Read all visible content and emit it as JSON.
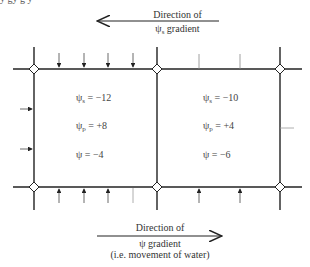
{
  "caption_fragment": "y       gy                    g y",
  "top_arrow": {
    "line1": "Direction of",
    "line2_symbol": "ψ",
    "line2_sub": "s",
    "line2_rest": " gradient",
    "direction": "left"
  },
  "bottom_arrow": {
    "line1": "Direction of",
    "line2": "ψ gradient",
    "line3": "(i.e. movement of water)",
    "direction": "right"
  },
  "cells": [
    {
      "name": "left-cell",
      "psi_s_label": "ψ",
      "psi_s_sub": "s",
      "psi_s_value": " = −12",
      "psi_p_label": "ψ",
      "psi_p_sub": "p",
      "psi_p_value": " = +8",
      "psi_label": "ψ",
      "psi_value": " = −4"
    },
    {
      "name": "right-cell",
      "psi_s_label": "ψ",
      "psi_s_sub": "s",
      "psi_s_value": " = −10",
      "psi_p_label": "ψ",
      "psi_p_sub": "p",
      "psi_p_value": " = +4",
      "psi_label": "ψ",
      "psi_value": " = −6"
    }
  ],
  "colors": {
    "line": "#222222",
    "faint_line": "#999999",
    "text": "#333333"
  }
}
